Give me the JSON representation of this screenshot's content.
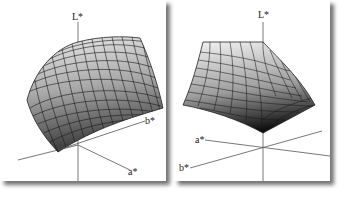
{
  "figure": {
    "panels": [
      {
        "id": "left",
        "description": "3D surface in CIELAB space (view 1)",
        "axes": {
          "l_label": "L*",
          "a_label": "a*",
          "b_label": "b*"
        }
      },
      {
        "id": "right",
        "description": "3D surface in CIELAB space (view 2)",
        "axes": {
          "l_label": "L*",
          "a_label": "a*",
          "b_label": "b*"
        }
      }
    ],
    "colors": {
      "surface_light": "#e6e6e6",
      "surface_mid": "#9a9a9a",
      "surface_dark": "#1e1e1e",
      "grid_line": "#2a2a2a",
      "axis_line": "#444444",
      "panel_bg": "#ffffff"
    }
  }
}
